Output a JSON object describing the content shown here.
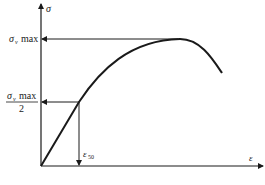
{
  "diagram": {
    "type": "stress-strain curve",
    "y_axis_label": "σ",
    "x_axis_label": "ε",
    "max_label": {
      "symbol": "σ",
      "subscript": "v",
      "text": "max"
    },
    "half_max_label": {
      "numerator_symbol": "σ",
      "numerator_subscript": "v",
      "numerator_text": "max",
      "denominator": "2"
    },
    "strain_label": {
      "symbol": "ε",
      "subscript": "50"
    },
    "colors": {
      "line": "#1a1a1a",
      "background": "#ffffff"
    }
  }
}
